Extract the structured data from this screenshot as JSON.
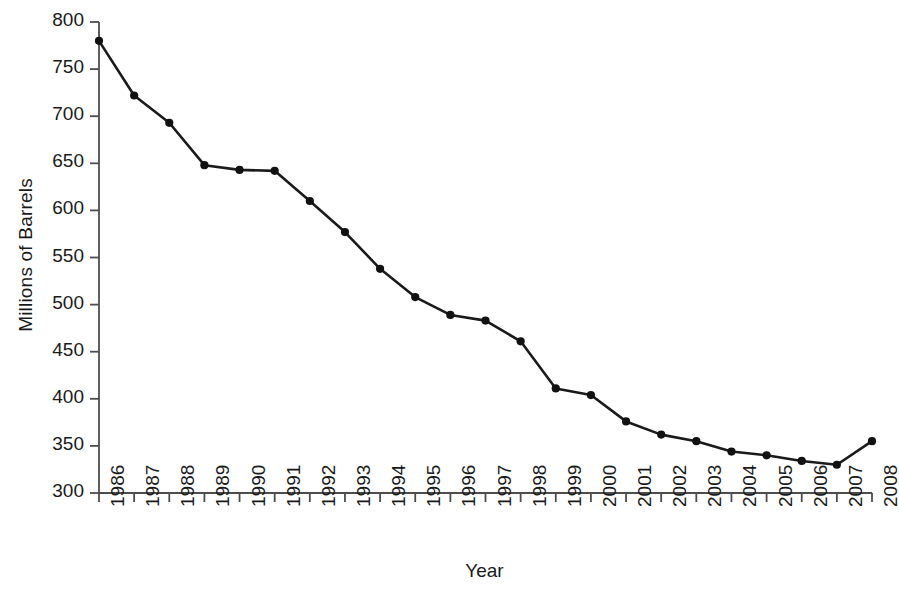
{
  "chart_data": {
    "type": "line",
    "title": "",
    "xlabel": "Year",
    "ylabel": "Millions of Barrels",
    "categories": [
      "1986",
      "1987",
      "1988",
      "1989",
      "1990",
      "1991",
      "1992",
      "1993",
      "1994",
      "1995",
      "1996",
      "1997",
      "1998",
      "1999",
      "2000",
      "2001",
      "2002",
      "2003",
      "2004",
      "2005",
      "2006",
      "2007",
      "2008"
    ],
    "values": [
      780,
      722,
      693,
      648,
      643,
      642,
      610,
      577,
      538,
      508,
      489,
      483,
      461,
      411,
      404,
      376,
      362,
      355,
      344,
      340,
      334,
      330,
      355
    ],
    "ylim": [
      300,
      800
    ],
    "yticks": [
      300,
      350,
      400,
      450,
      500,
      550,
      600,
      650,
      700,
      750,
      800
    ],
    "ytick_labels": [
      "300",
      "350",
      "400",
      "450",
      "500",
      "550",
      "600",
      "650",
      "700",
      "750",
      "800"
    ],
    "grid": false,
    "legend": false,
    "legend_position": "none",
    "series": [
      {
        "name": "Millions of Barrels",
        "color": "#1a1a1a",
        "marker": "circle",
        "values": [
          780,
          722,
          693,
          648,
          643,
          642,
          610,
          577,
          538,
          508,
          489,
          483,
          461,
          411,
          404,
          376,
          362,
          355,
          344,
          340,
          334,
          330,
          355
        ]
      }
    ],
    "axis_color": "#4d4d4d",
    "line_color": "#1a1a1a",
    "marker_color": "#111111"
  }
}
